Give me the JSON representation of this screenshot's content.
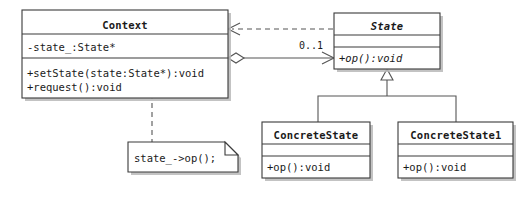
{
  "diagram": {
    "type": "uml-class-diagram",
    "colors": {
      "background": "#ffffff",
      "box_fill": "#ffffff",
      "box_stroke": "#3a3a3a",
      "edge_stroke": "#555555",
      "shadow": "#b9b9b9",
      "text": "#1a1a1a"
    }
  },
  "classes": {
    "context": {
      "name": "Context",
      "abstract": false,
      "attributes": [
        "-state_:State*"
      ],
      "operations": [
        "+setState(state:State*):void",
        "+request():void"
      ]
    },
    "state": {
      "name": "State",
      "abstract": true,
      "attributes": [],
      "operations": [
        "+op():void"
      ]
    },
    "concrete_state": {
      "name": "ConcreteState",
      "abstract": false,
      "attributes": [],
      "operations": [
        "+op():void"
      ]
    },
    "concrete_state1": {
      "name": "ConcreteState1",
      "abstract": false,
      "attributes": [],
      "operations": [
        "+op():void"
      ]
    }
  },
  "note": {
    "text": "state_->op();",
    "anchor": "+request():void"
  },
  "relations": {
    "aggregation": {
      "from": "Context",
      "to": "State",
      "source_marker": "hollow-diamond",
      "target_marker": "open-arrow",
      "target_multiplicity": "0..1",
      "style": "solid"
    },
    "dependency": {
      "from": "State",
      "to": "Context",
      "target_marker": "open-arrow",
      "style": "dashed"
    },
    "generalization_concrete_state": {
      "from": "ConcreteState",
      "to": "State",
      "target_marker": "hollow-triangle",
      "style": "solid"
    },
    "generalization_concrete_state1": {
      "from": "ConcreteState1",
      "to": "State",
      "target_marker": "hollow-triangle",
      "style": "solid"
    },
    "note_link": {
      "from": "note",
      "to": "Context.request",
      "style": "dashed"
    }
  }
}
